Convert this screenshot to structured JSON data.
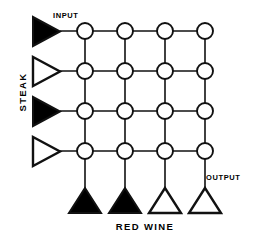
{
  "diagram": {
    "colors": {
      "stroke": "#111111",
      "fill_solid": "#000000",
      "fill_hollow": "#ffffff",
      "background": "#ffffff"
    },
    "annotations": {
      "input_label": "INPUT",
      "output_label": "OUTPUT"
    },
    "axes": {
      "row_axis_label": "STEAK",
      "column_axis_label": "RED WINE"
    },
    "grid": {
      "rows": 4,
      "columns": 4,
      "node_shape": "circle",
      "node_radius": 8,
      "origin_x": 85,
      "origin_y": 31,
      "spacing_x": 40,
      "spacing_y": 40
    },
    "input_units": [
      {
        "index": 0,
        "shape": "triangle-right",
        "fill": "solid",
        "row": 0
      },
      {
        "index": 1,
        "shape": "triangle-right",
        "fill": "hollow",
        "row": 1
      },
      {
        "index": 2,
        "shape": "triangle-right",
        "fill": "solid",
        "row": 2
      },
      {
        "index": 3,
        "shape": "triangle-right",
        "fill": "hollow",
        "row": 3
      }
    ],
    "output_units": [
      {
        "index": 0,
        "shape": "triangle-up",
        "fill": "solid",
        "column": 0
      },
      {
        "index": 1,
        "shape": "triangle-up",
        "fill": "solid",
        "column": 1
      },
      {
        "index": 2,
        "shape": "triangle-up",
        "fill": "hollow",
        "column": 2
      },
      {
        "index": 3,
        "shape": "triangle-up",
        "fill": "hollow",
        "column": 3
      }
    ]
  }
}
